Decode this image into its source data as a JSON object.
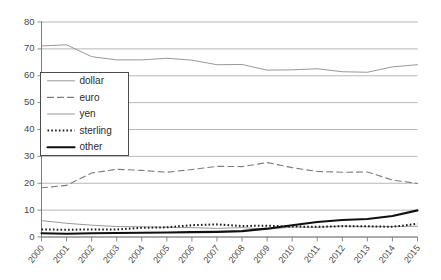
{
  "chart_data": {
    "type": "line",
    "title": "",
    "xlabel": "",
    "ylabel": "",
    "ylim": [
      0,
      80
    ],
    "ytick_step": 10,
    "grid": true,
    "legend_position": "inside-left",
    "categories": [
      "2000",
      "2001",
      "2002",
      "2003",
      "2004",
      "2005",
      "2006",
      "2007",
      "2008",
      "2009",
      "2010",
      "2011",
      "2012",
      "2013",
      "2014",
      "2015"
    ],
    "yticks": [
      "0",
      "10",
      "20",
      "30",
      "40",
      "50",
      "60",
      "70",
      "80"
    ],
    "series": [
      {
        "name": "dollar",
        "style": "thin-solid",
        "color": "#8c8c8c",
        "values": [
          71.1,
          71.5,
          67.1,
          65.9,
          65.9,
          66.5,
          65.8,
          64.1,
          64.2,
          62.1,
          62.2,
          62.6,
          61.5,
          61.3,
          63.3,
          64.1
        ]
      },
      {
        "name": "euro",
        "style": "dashed",
        "color": "#7d7d7d",
        "values": [
          18.3,
          19.2,
          23.8,
          25.2,
          24.8,
          24.1,
          25.1,
          26.3,
          26.2,
          27.7,
          25.8,
          24.4,
          24.1,
          24.2,
          21.2,
          19.9
        ]
      },
      {
        "name": "yen",
        "style": "thin-solid",
        "color": "#8c8c8c",
        "values": [
          6.1,
          5.1,
          4.4,
          3.9,
          3.8,
          3.6,
          3.5,
          3.2,
          3.5,
          2.9,
          3.7,
          3.6,
          4.1,
          3.8,
          3.9,
          4.0
        ]
      },
      {
        "name": "sterling",
        "style": "dotted",
        "color": "#1c1c1c",
        "values": [
          2.8,
          2.7,
          2.8,
          2.8,
          3.4,
          3.6,
          4.4,
          4.7,
          4.1,
          4.2,
          3.9,
          3.8,
          4.0,
          4.0,
          3.8,
          4.9
        ]
      },
      {
        "name": "other",
        "style": "thick-solid",
        "color": "#101010",
        "values": [
          1.4,
          1.2,
          1.4,
          1.5,
          1.6,
          1.7,
          1.8,
          1.9,
          2.2,
          3.1,
          4.4,
          5.6,
          6.3,
          6.7,
          7.8,
          9.9
        ]
      }
    ]
  },
  "legend": {
    "entries": [
      {
        "label": "dollar"
      },
      {
        "label": "euro"
      },
      {
        "label": "yen"
      },
      {
        "label": "sterling"
      },
      {
        "label": "other"
      }
    ]
  }
}
